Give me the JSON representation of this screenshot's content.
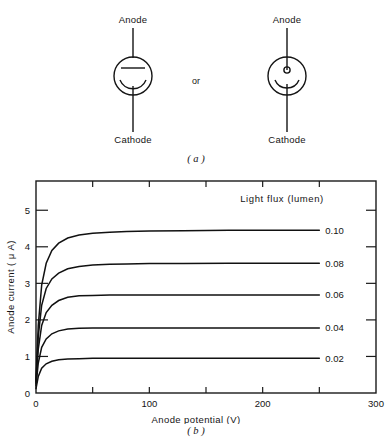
{
  "figure": {
    "panel_a": {
      "caption": "( a )",
      "or_text": "or",
      "symbols": [
        {
          "name": "phototube-plate-anode",
          "anode_label": "Anode",
          "cathode_label": "Cathode",
          "anode_element": "horizontal-bar",
          "cathode_element": "arc"
        },
        {
          "name": "phototube-point-anode",
          "anode_label": "Anode",
          "cathode_label": "Cathode",
          "anode_element": "small-circle",
          "cathode_element": "arc"
        }
      ]
    },
    "panel_b": {
      "caption": "( b )"
    }
  },
  "chart_data": {
    "type": "line",
    "title": "",
    "xlabel": "Anode potential  (V)",
    "ylabel": "Anode current ( μ A)",
    "legend_title": "Light  flux   (lumen)",
    "legend_position": "right-of-curves",
    "grid": false,
    "xlim": [
      0,
      300
    ],
    "ylim": [
      0,
      5.8
    ],
    "xticks": [
      0,
      100,
      200,
      300
    ],
    "xtick_labels": [
      "0",
      "100",
      "200",
      "300"
    ],
    "xticks_minor": [
      50,
      150,
      250
    ],
    "yticks": [
      0,
      1,
      2,
      3,
      4,
      5
    ],
    "ytick_labels": [
      "0",
      "1",
      "2",
      "3",
      "4",
      "5"
    ],
    "series": [
      {
        "name": "0.10",
        "label": "0.10",
        "saturation_current": 4.45,
        "x": [
          0,
          2,
          5,
          9,
          14,
          20,
          28,
          38,
          50,
          65,
          80,
          100,
          130,
          170,
          210,
          250
        ],
        "values": [
          0.35,
          1.85,
          2.95,
          3.55,
          3.9,
          4.1,
          4.24,
          4.32,
          4.37,
          4.4,
          4.42,
          4.43,
          4.44,
          4.45,
          4.45,
          4.45
        ]
      },
      {
        "name": "0.08",
        "label": "0.08",
        "saturation_current": 3.55,
        "x": [
          0,
          2,
          5,
          9,
          14,
          20,
          28,
          38,
          50,
          65,
          80,
          100,
          130,
          170,
          210,
          250
        ],
        "values": [
          0.3,
          1.55,
          2.4,
          2.86,
          3.12,
          3.28,
          3.4,
          3.46,
          3.5,
          3.52,
          3.53,
          3.54,
          3.54,
          3.55,
          3.55,
          3.55
        ]
      },
      {
        "name": "0.06",
        "label": "0.06",
        "saturation_current": 2.68,
        "x": [
          0,
          2,
          5,
          9,
          14,
          20,
          28,
          38,
          50,
          65,
          80,
          100,
          130,
          170,
          210,
          250
        ],
        "values": [
          0.25,
          1.2,
          1.85,
          2.2,
          2.4,
          2.53,
          2.62,
          2.66,
          2.67,
          2.68,
          2.68,
          2.68,
          2.68,
          2.68,
          2.68,
          2.68
        ]
      },
      {
        "name": "0.04",
        "label": "0.04",
        "saturation_current": 1.78,
        "x": [
          0,
          2,
          5,
          9,
          14,
          20,
          28,
          38,
          50,
          65,
          80,
          100,
          130,
          170,
          210,
          250
        ],
        "values": [
          0.2,
          0.82,
          1.25,
          1.48,
          1.62,
          1.7,
          1.75,
          1.77,
          1.78,
          1.78,
          1.78,
          1.78,
          1.78,
          1.78,
          1.78,
          1.78
        ]
      },
      {
        "name": "0.02",
        "label": "0.02",
        "saturation_current": 0.95,
        "x": [
          0,
          2,
          5,
          9,
          14,
          20,
          28,
          38,
          50,
          65,
          80,
          100,
          130,
          170,
          210,
          250
        ],
        "values": [
          0.12,
          0.45,
          0.68,
          0.8,
          0.87,
          0.91,
          0.93,
          0.94,
          0.95,
          0.95,
          0.95,
          0.95,
          0.95,
          0.95,
          0.95,
          0.95
        ]
      }
    ]
  },
  "colors": {
    "ink": "#141414",
    "curve": "#111111",
    "background": "#ffffff"
  }
}
